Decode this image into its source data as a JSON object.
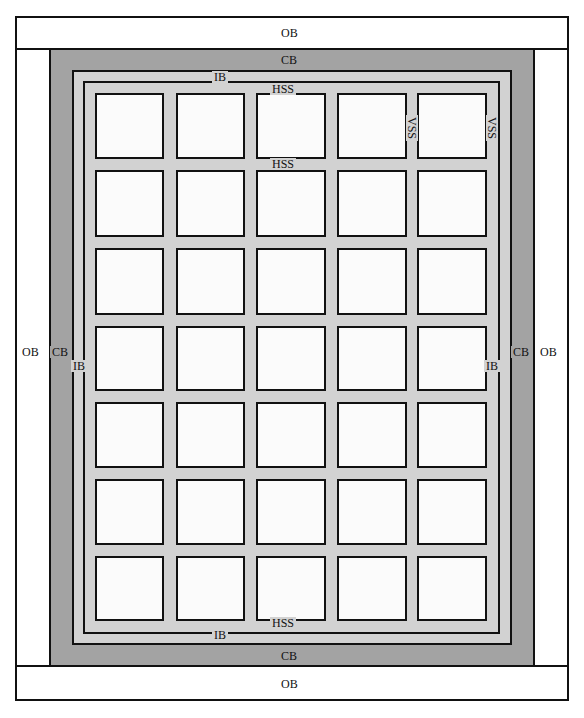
{
  "diagram": {
    "colors": {
      "outer_border": "#ffffff",
      "contrast_border": "#a3a3a3",
      "inner_border": "#d2d2d2",
      "sashing": "#d2d2d2",
      "block": "#fbfbfb",
      "outline": "#111111"
    },
    "grid": {
      "columns": 5,
      "rows": 7
    },
    "labels": {
      "ob_top": "OB",
      "ob_bottom": "OB",
      "ob_left": "OB",
      "ob_right": "OB",
      "cb_top": "CB",
      "cb_bottom": "CB",
      "cb_left": "CB",
      "cb_right": "CB",
      "ib_top": "IB",
      "ib_bottom": "IB",
      "ib_left": "IB",
      "ib_right": "IB",
      "hss_top": "HSS",
      "hss_second": "HSS",
      "hss_bottom": "HSS",
      "vss_inner": "VSS",
      "vss_right": "VSS"
    },
    "legend_terms": [
      {
        "abbr": "OB",
        "meaning": "Outer Border"
      },
      {
        "abbr": "CB",
        "meaning": "Contrast Border"
      },
      {
        "abbr": "IB",
        "meaning": "Inner Border"
      },
      {
        "abbr": "HSS",
        "meaning": "Horizontal Sashing Strip"
      },
      {
        "abbr": "VSS",
        "meaning": "Vertical Sashing Strip"
      }
    ]
  }
}
